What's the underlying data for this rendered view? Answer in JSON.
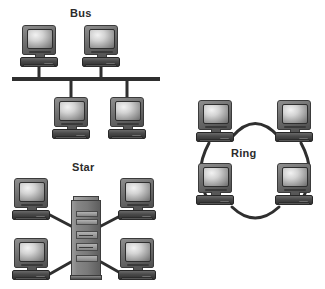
{
  "diagram": {
    "background_color": "#ffffff",
    "line_color": "#2f2f2f",
    "label_color": "#2b2b2b"
  },
  "topologies": [
    {
      "id": "bus",
      "label": "Bus",
      "label_x": 70,
      "label_y": 8,
      "node_count": 4,
      "link_style": "straight",
      "nodes": [
        {
          "name": "bus-computer-top-left",
          "x": 20,
          "y": 25
        },
        {
          "name": "bus-computer-top-right",
          "x": 82,
          "y": 25
        },
        {
          "name": "bus-computer-bottom-left",
          "x": 52,
          "y": 97
        },
        {
          "name": "bus-computer-bottom-right",
          "x": 108,
          "y": 97
        }
      ],
      "backbone": {
        "x1": 12,
        "x2": 160,
        "y": 79,
        "thickness": 4
      },
      "drops": [
        {
          "x": 39,
          "y1": 67,
          "y2": 79
        },
        {
          "x": 101,
          "y1": 67,
          "y2": 79
        },
        {
          "x": 71,
          "y1": 79,
          "y2": 97
        },
        {
          "x": 127,
          "y1": 79,
          "y2": 97
        }
      ]
    },
    {
      "id": "ring",
      "label": "Ring",
      "label_x": 231,
      "label_y": 148,
      "node_count": 4,
      "link_style": "curved-arc",
      "nodes": [
        {
          "name": "ring-computer-top-left",
          "x": 196,
          "y": 100
        },
        {
          "name": "ring-computer-top-right",
          "x": 275,
          "y": 100
        },
        {
          "name": "ring-computer-bottom-left",
          "x": 196,
          "y": 163
        },
        {
          "name": "ring-computer-bottom-right",
          "x": 275,
          "y": 163
        }
      ],
      "arcs": [
        {
          "name": "ring-arc-top",
          "d": "M 232 137 Q 255 110 279 137"
        },
        {
          "name": "ring-arc-right",
          "d": "M 300 143 Q 318 174 300 200"
        },
        {
          "name": "ring-arc-bottom",
          "d": "M 232 206 Q 255 228 279 206"
        },
        {
          "name": "ring-arc-left",
          "d": "M 210 143 Q 192 174 210 200"
        }
      ]
    },
    {
      "id": "star",
      "label": "Star",
      "label_x": 72,
      "label_y": 162,
      "node_count": 4,
      "hub": {
        "name": "star-server",
        "x": 71,
        "y": 196,
        "type": "server-tower"
      },
      "link_style": "straight-spoke",
      "nodes": [
        {
          "name": "star-computer-top-left",
          "x": 12,
          "y": 178
        },
        {
          "name": "star-computer-top-right",
          "x": 118,
          "y": 178
        },
        {
          "name": "star-computer-bottom-left",
          "x": 12,
          "y": 238
        },
        {
          "name": "star-computer-bottom-right",
          "x": 118,
          "y": 238
        }
      ],
      "spokes": [
        {
          "name": "star-spoke-top-left",
          "x1": 49,
          "y1": 214,
          "x2": 70,
          "y2": 225
        },
        {
          "name": "star-spoke-top-right",
          "x1": 101,
          "y1": 225,
          "x2": 119,
          "y2": 214
        },
        {
          "name": "star-spoke-bottom-left",
          "x1": 49,
          "y1": 274,
          "x2": 70,
          "y2": 262
        },
        {
          "name": "star-spoke-bottom-right",
          "x1": 101,
          "y1": 262,
          "x2": 119,
          "y2": 274
        }
      ]
    }
  ]
}
